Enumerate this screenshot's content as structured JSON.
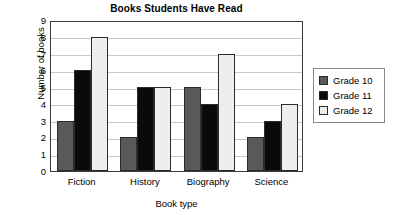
{
  "chart_data": {
    "type": "bar",
    "title": "Books Students Have Read",
    "xlabel": "Book type",
    "ylabel": "Number of books",
    "categories": [
      "Fiction",
      "History",
      "Biography",
      "Science"
    ],
    "series": [
      {
        "name": "Grade 10",
        "color": "#595959",
        "values": [
          3,
          2,
          5,
          2
        ]
      },
      {
        "name": "Grade 11",
        "color": "#0a0a0a",
        "values": [
          6,
          5,
          4,
          3
        ]
      },
      {
        "name": "Grade 12",
        "color": "#eeeeee",
        "values": [
          8,
          5,
          7,
          4
        ]
      }
    ],
    "ylim": [
      0,
      9
    ],
    "yticks": [
      0,
      1,
      2,
      3,
      4,
      5,
      6,
      7,
      8,
      9
    ],
    "ytick_labels": [
      "0",
      "1",
      "2",
      "3",
      "4",
      "5",
      "6",
      "7",
      "8",
      "9"
    ],
    "grid": true,
    "grid_axis": "y",
    "legend_position": "right",
    "bar_border_color": "#2b2b2b",
    "plot_border_color": "#3a3a3a",
    "gridline_color": "#c9c9c9",
    "background_color": "#ffffff"
  }
}
